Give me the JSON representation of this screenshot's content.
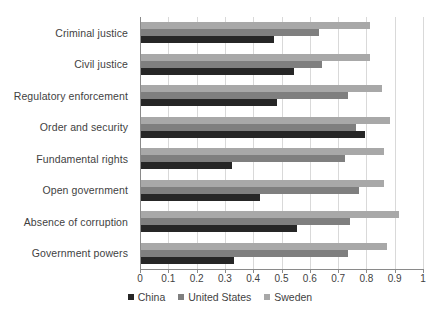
{
  "chart_data": {
    "type": "bar",
    "orientation": "horizontal",
    "title": "",
    "subtitle": "",
    "xlabel": "",
    "ylabel": "",
    "xlim": [
      0,
      1
    ],
    "grid": true,
    "legend_position": "bottom",
    "categories": [
      "Criminal justice",
      "Civil justice",
      "Regulatory enforcement",
      "Order and security",
      "Fundamental rights",
      "Open government",
      "Absence of corruption",
      "Government powers"
    ],
    "xticks": [
      "0",
      "0.1",
      "0.2",
      "0.3",
      "0.4",
      "0.5",
      "0.6",
      "0.7",
      "0.8",
      "0.9",
      "1"
    ],
    "xtick_values": [
      0,
      0.1,
      0.2,
      0.3,
      0.4,
      0.5,
      0.6,
      0.7,
      0.8,
      0.9,
      1
    ],
    "series": [
      {
        "name": "Sweden",
        "color": "#a8a8a8",
        "values": [
          0.81,
          0.81,
          0.85,
          0.88,
          0.86,
          0.86,
          0.91,
          0.87
        ]
      },
      {
        "name": "United States",
        "color": "#7f7f7f",
        "values": [
          0.63,
          0.64,
          0.73,
          0.76,
          0.72,
          0.77,
          0.74,
          0.73
        ]
      },
      {
        "name": "China",
        "color": "#262626",
        "values": [
          0.47,
          0.54,
          0.48,
          0.79,
          0.32,
          0.42,
          0.55,
          0.33
        ]
      }
    ],
    "legend": [
      {
        "label": "China",
        "color": "#262626"
      },
      {
        "label": "United States",
        "color": "#7f7f7f"
      },
      {
        "label": "Sweden",
        "color": "#a8a8a8"
      }
    ]
  }
}
